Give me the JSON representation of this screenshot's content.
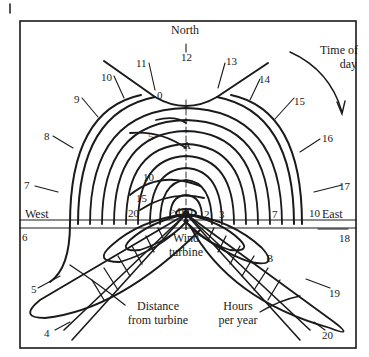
{
  "diagram": {
    "type": "shadow-flicker polar diagram",
    "compass": {
      "north": "North",
      "west": "West",
      "east": "East"
    },
    "time_of_day_label": "Time of day",
    "time_of_day_label_lines": [
      "Time of",
      "day"
    ],
    "hour_labels": {
      "h0": "0",
      "h4": "4",
      "h5": "5",
      "h6": "6",
      "h7": "7",
      "h8": "8",
      "h9": "9",
      "h10": "10",
      "h11": "11",
      "h12": "12",
      "h13": "13",
      "h14": "14",
      "h15": "15",
      "h16": "16",
      "h17": "17",
      "h18": "18",
      "h19": "19",
      "h20": "20"
    },
    "hours_per_year_contours": {
      "c0": "0",
      "c5": "5",
      "c10": "10",
      "c15": "15",
      "c20": "20",
      "c100": ">100",
      "c2": "2",
      "c3": "3",
      "c7": "7",
      "c10e": "10"
    },
    "points": {
      "a": "A",
      "b": "B"
    },
    "turbine_label_lines": [
      "Wind",
      "turbine"
    ],
    "distance_label_lines": [
      "Distance",
      "from turbine"
    ],
    "hours_label_lines": [
      "Hours",
      "per year"
    ],
    "colors": {
      "ink": "#1a1a1a",
      "background": "#ffffff"
    }
  }
}
